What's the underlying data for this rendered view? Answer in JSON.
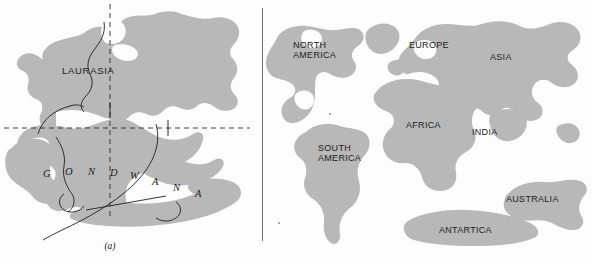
{
  "figure": {
    "type": "two-panel continental drift diagram",
    "width": 593,
    "height": 265,
    "background_color": "#fdfdfd",
    "landmass_color": "#b8b8b8",
    "outline_color": "#1c1c1c",
    "divider_color": "#6f6f6f"
  },
  "panel_a": {
    "caption": "(a)",
    "title_hidden": "Pangaea supercontinent",
    "labels": {
      "laurasia": "LAURASIA",
      "gondwana_letters": [
        "G",
        "O",
        "N",
        "D",
        "W",
        "A",
        "N",
        "A"
      ]
    },
    "guide_lines": {
      "vertical_dashed": "prime meridian",
      "horizontal_dashed": "equator"
    }
  },
  "panel_b": {
    "caption": "(b)",
    "title_hidden": "Present-day continents",
    "continents": [
      {
        "id": "north-america",
        "name": "NORTH\nAMERICA"
      },
      {
        "id": "europe",
        "name": "EUROPE"
      },
      {
        "id": "asia",
        "name": "ASIA"
      },
      {
        "id": "africa",
        "name": "AFRICA"
      },
      {
        "id": "india",
        "name": "INDIA"
      },
      {
        "id": "south-america",
        "name": "SOUTH\nAMERICA"
      },
      {
        "id": "australia",
        "name": "AUSTRALIA"
      },
      {
        "id": "antartica",
        "name": "ANTARTICA"
      }
    ]
  }
}
